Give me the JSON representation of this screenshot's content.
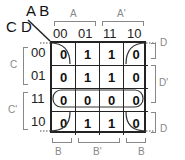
{
  "corner": {
    "row_vars": "C D",
    "col_vars": "A B"
  },
  "columns": [
    "00",
    "01",
    "11",
    "10"
  ],
  "rows": [
    "00",
    "01",
    "11",
    "10"
  ],
  "cells": [
    [
      "0",
      "1",
      "1",
      "0"
    ],
    [
      "0",
      "1",
      "1",
      "0"
    ],
    [
      "0",
      "0",
      "0",
      "0"
    ],
    [
      "0",
      "1",
      "1",
      "0"
    ]
  ],
  "top_groups": [
    {
      "label": "A"
    },
    {
      "label": "A'"
    }
  ],
  "bottom_groups": [
    {
      "label": "B"
    },
    {
      "label": "B'"
    },
    {
      "label": "B"
    }
  ],
  "left_groups": [
    {
      "label": "C"
    },
    {
      "label": "C'"
    }
  ],
  "right_groups": [
    {
      "label": "D"
    },
    {
      "label": "D'"
    },
    {
      "label": "D"
    }
  ],
  "groupings": [
    {
      "name": "row-11-zeros",
      "description": "Horizontal loop around row 11 (all 0s)"
    },
    {
      "name": "corner-zeros",
      "description": "Wrap-around loop of the four corner 0s"
    }
  ]
}
